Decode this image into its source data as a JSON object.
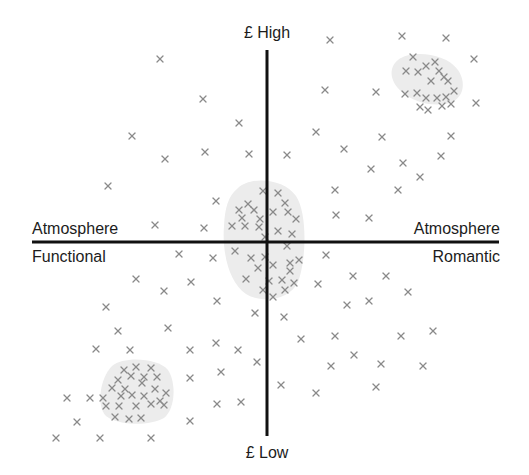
{
  "diagram": {
    "type": "perceptual_map",
    "axes": {
      "vertical": {
        "name": "Price",
        "top_label": "£ High",
        "bottom_label": "£ Low"
      },
      "horizontal": {
        "name": "Atmosphere",
        "left_label_top": "Atmosphere",
        "left_label_bottom": "Functional",
        "right_label_top": "Atmosphere",
        "right_label_bottom": "Romantic"
      }
    },
    "colors": {
      "axis": "#111111",
      "marker": "#8a8a8a",
      "cluster_fill": "#ececec",
      "text": "#1c1c1c"
    },
    "clusters": [
      {
        "name": "high-price-romantic-cluster",
        "quadrant": "top-right",
        "shape": "M398,60 C410,50 445,52 458,70 C468,85 462,102 445,104 C428,106 414,102 402,92 C390,82 388,68 398,60 Z",
        "points": [
          [
            413,
            57
          ],
          [
            406,
            71
          ],
          [
            418,
            72
          ],
          [
            426,
            66
          ],
          [
            435,
            62
          ],
          [
            439,
            71
          ],
          [
            444,
            77
          ],
          [
            431,
            81
          ],
          [
            405,
            94
          ],
          [
            417,
            93
          ],
          [
            426,
            98
          ],
          [
            448,
            81
          ],
          [
            454,
            91
          ],
          [
            446,
            97
          ],
          [
            437,
            98
          ],
          [
            442,
            106
          ],
          [
            451,
            104
          ],
          [
            420,
            107
          ],
          [
            428,
            110
          ]
        ]
      },
      {
        "name": "mid-price-cluster",
        "quadrant": "center",
        "shape": "M238,188 C250,176 284,178 296,196 C308,214 306,262 298,282 C290,300 262,304 246,294 C228,282 222,250 224,226 C225,208 228,196 238,188 Z",
        "points": [
          [
            263,
            191
          ],
          [
            278,
            193
          ],
          [
            285,
            203
          ],
          [
            248,
            204
          ],
          [
            239,
            210
          ],
          [
            254,
            210
          ],
          [
            242,
            218
          ],
          [
            260,
            219
          ],
          [
            273,
            212
          ],
          [
            288,
            212
          ],
          [
            296,
            219
          ],
          [
            232,
            226
          ],
          [
            245,
            226
          ],
          [
            259,
            227
          ],
          [
            278,
            231
          ],
          [
            292,
            234
          ],
          [
            265,
            237
          ],
          [
            287,
            246
          ],
          [
            235,
            251
          ],
          [
            251,
            258
          ],
          [
            265,
            257
          ],
          [
            273,
            265
          ],
          [
            290,
            263
          ],
          [
            299,
            260
          ],
          [
            258,
            268
          ],
          [
            282,
            280
          ],
          [
            290,
            271
          ],
          [
            246,
            279
          ],
          [
            269,
            281
          ],
          [
            263,
            290
          ],
          [
            285,
            290
          ],
          [
            294,
            283
          ],
          [
            273,
            297
          ]
        ]
      },
      {
        "name": "low-price-functional-cluster",
        "quadrant": "bottom-left",
        "shape": "M112,366 C124,356 158,358 168,370 C176,382 176,408 164,418 C150,426 118,426 106,416 C96,406 100,378 112,366 Z",
        "points": [
          [
            124,
            370
          ],
          [
            136,
            367
          ],
          [
            151,
            368
          ],
          [
            118,
            380
          ],
          [
            131,
            376
          ],
          [
            144,
            377
          ],
          [
            157,
            377
          ],
          [
            112,
            388
          ],
          [
            125,
            389
          ],
          [
            142,
            383
          ],
          [
            155,
            389
          ],
          [
            166,
            393
          ],
          [
            103,
            398
          ],
          [
            121,
            396
          ],
          [
            132,
            395
          ],
          [
            144,
            396
          ],
          [
            160,
            401
          ],
          [
            106,
            406
          ],
          [
            119,
            406
          ],
          [
            136,
            406
          ],
          [
            151,
            404
          ],
          [
            164,
            405
          ],
          [
            115,
            417
          ],
          [
            141,
            418
          ],
          [
            129,
            419
          ]
        ]
      }
    ],
    "scattered_points": {
      "top_left": [
        [
          160,
          59
        ],
        [
          203,
          99
        ],
        [
          239,
          123
        ],
        [
          132,
          136
        ],
        [
          165,
          159
        ],
        [
          205,
          152
        ],
        [
          249,
          154
        ],
        [
          108,
          186
        ],
        [
          216,
          201
        ],
        [
          155,
          225
        ],
        [
          204,
          228
        ]
      ],
      "top_right": [
        [
          330,
          40
        ],
        [
          402,
          36
        ],
        [
          446,
          38
        ],
        [
          474,
          59
        ],
        [
          325,
          90
        ],
        [
          376,
          92
        ],
        [
          476,
          103
        ],
        [
          316,
          132
        ],
        [
          382,
          137
        ],
        [
          451,
          136
        ],
        [
          344,
          149
        ],
        [
          287,
          155
        ],
        [
          441,
          156
        ],
        [
          403,
          163
        ],
        [
          371,
          169
        ],
        [
          420,
          177
        ],
        [
          335,
          190
        ],
        [
          398,
          190
        ],
        [
          336,
          215
        ],
        [
          369,
          218
        ]
      ],
      "bottom_left": [
        [
          179,
          254
        ],
        [
          213,
          258
        ],
        [
          136,
          279
        ],
        [
          191,
          282
        ],
        [
          164,
          291
        ],
        [
          217,
          301
        ],
        [
          106,
          307
        ],
        [
          118,
          331
        ],
        [
          168,
          328
        ],
        [
          130,
          350
        ],
        [
          96,
          349
        ],
        [
          190,
          350
        ],
        [
          216,
          343
        ],
        [
          238,
          350
        ],
        [
          255,
          313
        ],
        [
          257,
          362
        ],
        [
          190,
          378
        ],
        [
          221,
          372
        ],
        [
          90,
          398
        ],
        [
          67,
          398
        ],
        [
          77,
          422
        ],
        [
          190,
          421
        ],
        [
          217,
          404
        ],
        [
          241,
          402
        ],
        [
          56,
          438
        ],
        [
          100,
          438
        ],
        [
          151,
          438
        ]
      ],
      "bottom_right": [
        [
          326,
          255
        ],
        [
          318,
          284
        ],
        [
          353,
          276
        ],
        [
          386,
          276
        ],
        [
          369,
          301
        ],
        [
          347,
          305
        ],
        [
          408,
          292
        ],
        [
          284,
          317
        ],
        [
          301,
          339
        ],
        [
          335,
          336
        ],
        [
          401,
          336
        ],
        [
          433,
          331
        ],
        [
          354,
          355
        ],
        [
          331,
          366
        ],
        [
          381,
          364
        ],
        [
          423,
          366
        ],
        [
          281,
          385
        ],
        [
          316,
          393
        ],
        [
          376,
          387
        ]
      ]
    }
  }
}
